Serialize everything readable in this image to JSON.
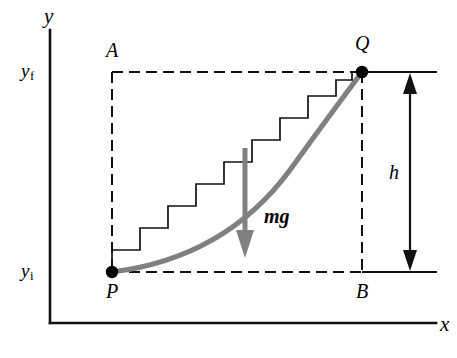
{
  "figure": {
    "kind": "physics-diagram",
    "background_color": "#ffffff",
    "ink_color": "#000000",
    "curve_color": "#808080",
    "force_arrow_color": "#808080"
  },
  "axes": {
    "y_label": "y",
    "x_label": "x",
    "y_ticks": [
      {
        "id": "yf",
        "base": "y",
        "subscript": "f",
        "text": "yf"
      },
      {
        "id": "yi",
        "base": "y",
        "subscript": "i",
        "text": "yi"
      }
    ]
  },
  "points": [
    {
      "id": "P",
      "label": "P",
      "role": "initial-position"
    },
    {
      "id": "Q",
      "label": "Q",
      "role": "final-position"
    }
  ],
  "corners": [
    {
      "id": "A",
      "label": "A",
      "role": "rectangle-top-left"
    },
    {
      "id": "B",
      "label": "B",
      "role": "rectangle-bottom-right"
    }
  ],
  "force": {
    "label": "mg",
    "direction": "down",
    "color": "#808080"
  },
  "dimension": {
    "label": "h",
    "meaning": "vertical-height-difference",
    "style": "double-headed-arrow"
  },
  "staircase": {
    "step_count": 9,
    "line_style": "solid-thin-black"
  },
  "icons": {
    "point_marker": "filled-circle-icon",
    "force_arrow": "down-arrow-icon",
    "height_arrow": "double-headed-vertical-arrow-icon"
  }
}
